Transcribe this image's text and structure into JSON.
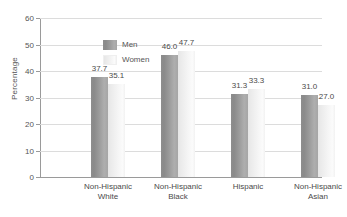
{
  "chart_data": {
    "type": "bar",
    "title": "",
    "subtitle": "",
    "xlabel": "",
    "ylabel": "Percentage",
    "ylim": [
      0,
      60
    ],
    "yticks": [
      0,
      10,
      20,
      30,
      40,
      50,
      60
    ],
    "ytick_labels": [
      "0",
      "10",
      "20",
      "30",
      "40",
      "50",
      "60"
    ],
    "grid": "horizontal",
    "legend_position": "inside-top-left",
    "categories": [
      "Non-Hispanic White",
      "Non-Hispanic Black",
      "Hispanic",
      "Non-Hispanic Asian"
    ],
    "category_lines": [
      [
        "Non-Hispanic",
        "White"
      ],
      [
        "Non-Hispanic",
        "Black"
      ],
      [
        "Hispanic",
        ""
      ],
      [
        "Non-Hispanic",
        "Asian"
      ]
    ],
    "series": [
      {
        "name": "Men",
        "color": "#9b9b9b",
        "values": [
          37.7,
          46.0,
          31.3,
          31.0
        ],
        "labels": [
          "37.7",
          "46.0",
          "31.3",
          "31.0"
        ]
      },
      {
        "name": "Women",
        "color": "#f0f0f0",
        "values": [
          35.1,
          47.7,
          33.3,
          27.0
        ],
        "labels": [
          "35.1",
          "47.7",
          "33.3",
          "27.0"
        ]
      }
    ]
  },
  "legend": {
    "items": [
      {
        "label": "Men"
      },
      {
        "label": "Women"
      }
    ]
  },
  "colors": {
    "men_bar": "#9b9b9b",
    "women_bar": "#f0f0f0",
    "gridline": "#dcdcdc",
    "axis": "#9a9a9a",
    "text": "#4a4a4a",
    "background": "#ffffff"
  }
}
